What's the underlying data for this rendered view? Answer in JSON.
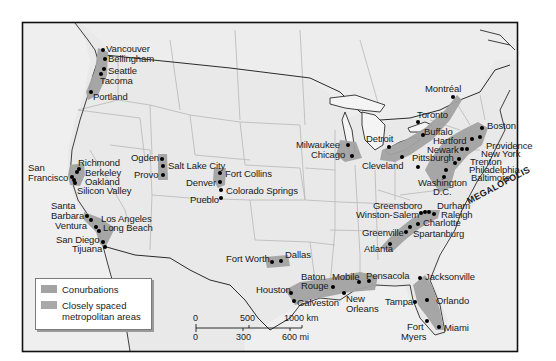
{
  "map": {
    "title": "Conurbations of North America",
    "colors": {
      "land": "#e9e9e9",
      "water": "#f2f2f2",
      "border": "#111111",
      "state_lines": "#b8b8b8",
      "conurbation": "#a3a3a3",
      "city_dot": "#000000"
    },
    "regions": {
      "megalopolis_label": "MEGALOPOLIS"
    },
    "cities": [
      {
        "name": "Vancouver",
        "x": 103,
        "y": 50
      },
      {
        "name": "Bellingham",
        "x": 105,
        "y": 59
      },
      {
        "name": "Seattle",
        "x": 104,
        "y": 69
      },
      {
        "name": "Tacoma",
        "x": 101,
        "y": 74
      },
      {
        "name": "Portland",
        "x": 91,
        "y": 92
      },
      {
        "name": "San Francisco",
        "x": 72,
        "y": 177
      },
      {
        "name": "Richmond",
        "x": 79,
        "y": 169
      },
      {
        "name": "Berkeley",
        "x": 77,
        "y": 172
      },
      {
        "name": "Oakland",
        "x": 77,
        "y": 177
      },
      {
        "name": "Silicon Valley",
        "x": 75,
        "y": 182
      },
      {
        "name": "Santa Barbara",
        "x": 87,
        "y": 216
      },
      {
        "name": "Ventura",
        "x": 91,
        "y": 220
      },
      {
        "name": "Los Angeles",
        "x": 97,
        "y": 227
      },
      {
        "name": "Long Beach",
        "x": 99,
        "y": 231
      },
      {
        "name": "San Diego",
        "x": 103,
        "y": 242
      },
      {
        "name": "Tijuana",
        "x": 105,
        "y": 247
      },
      {
        "name": "Ogden",
        "x": 162,
        "y": 159
      },
      {
        "name": "Salt Lake City",
        "x": 163,
        "y": 166
      },
      {
        "name": "Provo",
        "x": 163,
        "y": 175
      },
      {
        "name": "Fort Collins",
        "x": 220,
        "y": 173
      },
      {
        "name": "Denver",
        "x": 220,
        "y": 182
      },
      {
        "name": "Colorado Springs",
        "x": 221,
        "y": 190
      },
      {
        "name": "Pueblo",
        "x": 221,
        "y": 198
      },
      {
        "name": "Fort Worth",
        "x": 271,
        "y": 262
      },
      {
        "name": "Dallas",
        "x": 281,
        "y": 261
      },
      {
        "name": "Houston",
        "x": 291,
        "y": 293
      },
      {
        "name": "Galveston",
        "x": 294,
        "y": 301
      },
      {
        "name": "Baton Rouge",
        "x": 333,
        "y": 287
      },
      {
        "name": "New Orleans",
        "x": 344,
        "y": 293
      },
      {
        "name": "Mobile",
        "x": 359,
        "y": 282
      },
      {
        "name": "Pensacola",
        "x": 369,
        "y": 281
      },
      {
        "name": "Milwaukee",
        "x": 348,
        "y": 145
      },
      {
        "name": "Chicago",
        "x": 352,
        "y": 156
      },
      {
        "name": "Detroit",
        "x": 389,
        "y": 147
      },
      {
        "name": "Cleveland",
        "x": 402,
        "y": 157
      },
      {
        "name": "Toronto",
        "x": 418,
        "y": 122
      },
      {
        "name": "Buffalo",
        "x": 423,
        "y": 135
      },
      {
        "name": "Montréal",
        "x": 453,
        "y": 97
      },
      {
        "name": "Pittsburgh",
        "x": 418,
        "y": 167
      },
      {
        "name": "Boston",
        "x": 482,
        "y": 128
      },
      {
        "name": "Hartford",
        "x": 472,
        "y": 139
      },
      {
        "name": "Providence",
        "x": 480,
        "y": 137
      },
      {
        "name": "Newark",
        "x": 462,
        "y": 149
      },
      {
        "name": "New York",
        "x": 467,
        "y": 149
      },
      {
        "name": "Trenton",
        "x": 459,
        "y": 159
      },
      {
        "name": "Philadelphia",
        "x": 455,
        "y": 163
      },
      {
        "name": "Baltimore",
        "x": 446,
        "y": 170
      },
      {
        "name": "Washington D.C.",
        "x": 444,
        "y": 177
      },
      {
        "name": "Greensboro",
        "x": 425,
        "y": 213
      },
      {
        "name": "Durham",
        "x": 428,
        "y": 213
      },
      {
        "name": "Winston-Salem",
        "x": 421,
        "y": 213
      },
      {
        "name": "Raleigh",
        "x": 434,
        "y": 214
      },
      {
        "name": "Charlotte",
        "x": 418,
        "y": 224
      },
      {
        "name": "Greenville",
        "x": 406,
        "y": 232
      },
      {
        "name": "Spartanburg",
        "x": 410,
        "y": 227
      },
      {
        "name": "Atlanta",
        "x": 390,
        "y": 244
      },
      {
        "name": "Jacksonville",
        "x": 420,
        "y": 278
      },
      {
        "name": "Tampa",
        "x": 415,
        "y": 302
      },
      {
        "name": "Orlando",
        "x": 427,
        "y": 300
      },
      {
        "name": "Fort Myers",
        "x": 427,
        "y": 321
      },
      {
        "name": "Miami",
        "x": 439,
        "y": 327
      }
    ],
    "labels": [
      {
        "text": "Vancouver",
        "x": 106,
        "y": 44
      },
      {
        "text": "Bellingham",
        "x": 108,
        "y": 54
      },
      {
        "text": "Seattle",
        "x": 108,
        "y": 66
      },
      {
        "text": "Tacoma",
        "x": 100,
        "y": 76
      },
      {
        "text": "Portland",
        "x": 93,
        "y": 92
      },
      {
        "text": "San",
        "x": 28,
        "y": 163
      },
      {
        "text": "Francisco",
        "x": 28,
        "y": 173
      },
      {
        "text": "Richmond",
        "x": 78,
        "y": 158
      },
      {
        "text": "Berkeley",
        "x": 85,
        "y": 168
      },
      {
        "text": "Oakland",
        "x": 85,
        "y": 177
      },
      {
        "text": "Silicon Valley",
        "x": 77,
        "y": 186
      },
      {
        "text": "Santa",
        "x": 51,
        "y": 201
      },
      {
        "text": "Barbara",
        "x": 51,
        "y": 211
      },
      {
        "text": "Ventura",
        "x": 55,
        "y": 221
      },
      {
        "text": "Los Angeles",
        "x": 101,
        "y": 214
      },
      {
        "text": "Long Beach",
        "x": 103,
        "y": 223
      },
      {
        "text": "San Diego",
        "x": 56,
        "y": 235
      },
      {
        "text": "Tijuana",
        "x": 72,
        "y": 244
      },
      {
        "text": "Ogden",
        "x": 131,
        "y": 153
      },
      {
        "text": "Salt Lake City",
        "x": 168,
        "y": 161
      },
      {
        "text": "Provo",
        "x": 134,
        "y": 170
      },
      {
        "text": "Fort Collins",
        "x": 225,
        "y": 169
      },
      {
        "text": "Denver",
        "x": 186,
        "y": 178
      },
      {
        "text": "Colorado Springs",
        "x": 226,
        "y": 186
      },
      {
        "text": "Pueblo",
        "x": 190,
        "y": 195
      },
      {
        "text": "Fort Worth",
        "x": 226,
        "y": 254
      },
      {
        "text": "Dallas",
        "x": 285,
        "y": 250
      },
      {
        "text": "Houston",
        "x": 256,
        "y": 285
      },
      {
        "text": "Galveston",
        "x": 297,
        "y": 298
      },
      {
        "text": "Baton",
        "x": 301,
        "y": 272
      },
      {
        "text": "Rouge",
        "x": 301,
        "y": 281
      },
      {
        "text": "Mobile",
        "x": 332,
        "y": 272
      },
      {
        "text": "Pensacola",
        "x": 366,
        "y": 271
      },
      {
        "text": "New",
        "x": 346,
        "y": 294
      },
      {
        "text": "Orleans",
        "x": 346,
        "y": 304
      },
      {
        "text": "Milwaukee",
        "x": 296,
        "y": 140
      },
      {
        "text": "Chicago",
        "x": 311,
        "y": 150
      },
      {
        "text": "Detroit",
        "x": 366,
        "y": 134
      },
      {
        "text": "Cleveland",
        "x": 362,
        "y": 161
      },
      {
        "text": "Toronto",
        "x": 417,
        "y": 110
      },
      {
        "text": "Buffalo",
        "x": 424,
        "y": 127
      },
      {
        "text": "Montréal",
        "x": 425,
        "y": 84
      },
      {
        "text": "Hartford",
        "x": 433,
        "y": 136
      },
      {
        "text": "Newark",
        "x": 427,
        "y": 145
      },
      {
        "text": "Pittsburgh",
        "x": 412,
        "y": 153
      },
      {
        "text": "Boston",
        "x": 487,
        "y": 121
      },
      {
        "text": "Providence",
        "x": 486,
        "y": 141
      },
      {
        "text": "New York",
        "x": 481,
        "y": 149
      },
      {
        "text": "Trenton",
        "x": 470,
        "y": 157
      },
      {
        "text": "Philadelphia",
        "x": 469,
        "y": 165
      },
      {
        "text": "Baltimore",
        "x": 471,
        "y": 173
      },
      {
        "text": "Washington",
        "x": 418,
        "y": 178
      },
      {
        "text": "D.C.",
        "x": 433,
        "y": 187
      },
      {
        "text": "Greensboro",
        "x": 373,
        "y": 201
      },
      {
        "text": "Durham",
        "x": 437,
        "y": 201
      },
      {
        "text": "Winston-Salem",
        "x": 356,
        "y": 210
      },
      {
        "text": "Raleigh",
        "x": 441,
        "y": 210
      },
      {
        "text": "Charlotte",
        "x": 423,
        "y": 218
      },
      {
        "text": "Greenville",
        "x": 362,
        "y": 228
      },
      {
        "text": "Spartanburg",
        "x": 413,
        "y": 229
      },
      {
        "text": "Atlanta",
        "x": 364,
        "y": 244
      },
      {
        "text": "Jacksonville",
        "x": 425,
        "y": 272
      },
      {
        "text": "Tampa",
        "x": 385,
        "y": 297
      },
      {
        "text": "Orlando",
        "x": 436,
        "y": 296
      },
      {
        "text": "Fort",
        "x": 407,
        "y": 322
      },
      {
        "text": "Myers",
        "x": 401,
        "y": 332
      },
      {
        "text": "Miami",
        "x": 444,
        "y": 323
      }
    ]
  },
  "legend": {
    "items": [
      {
        "label": "Conurbations"
      },
      {
        "label_line1": "Closely spaced",
        "label_line2": "metropolitan areas"
      }
    ]
  },
  "scale": {
    "km_ticks": [
      "0",
      "500",
      "1000 km"
    ],
    "mi_ticks": [
      "0",
      "300",
      "600 mi"
    ]
  }
}
